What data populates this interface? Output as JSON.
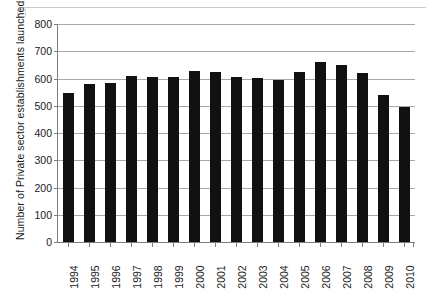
{
  "artifacts": {
    "ghost_text_left": "",
    "ghost_text_mid": ""
  },
  "chart_data": {
    "type": "bar",
    "title": "",
    "xlabel": "",
    "ylabel": "Number of Private sector establishments launched",
    "ylim": [
      0,
      800
    ],
    "y_ticks": [
      0,
      100,
      200,
      300,
      400,
      500,
      600,
      700,
      800
    ],
    "y_tick_labels": [
      "0",
      "100",
      "200",
      "300",
      "400",
      "500",
      "600",
      "700",
      "800"
    ],
    "grid": "horizontal",
    "legend": "none",
    "bar_color": "#111111",
    "categories": [
      "1994",
      "1995",
      "1996",
      "1997",
      "1998",
      "1999",
      "2000",
      "2001",
      "2002",
      "2003",
      "2004",
      "2005",
      "2006",
      "2007",
      "2008",
      "2009",
      "2010"
    ],
    "values": [
      548,
      580,
      585,
      610,
      605,
      605,
      628,
      625,
      607,
      603,
      596,
      625,
      660,
      648,
      621,
      540,
      497
    ]
  }
}
